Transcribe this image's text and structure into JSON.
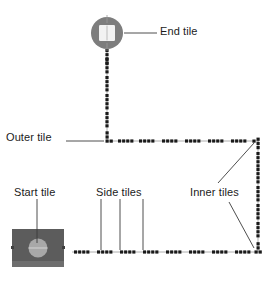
{
  "figure": {
    "background_color": "#ffffff",
    "tile_color": "#1a1a1a",
    "tile_track_color": "#9a9a9a",
    "start_tile_body_color": "#5c5c5c",
    "start_tile_base_color": "#6e6e6e",
    "start_tile_disc_color": "#a8a8a8",
    "end_tile_circle_color": "#7d7d7d",
    "end_tile_inner_color": "#f2f2f2",
    "leader_line_color": "#3a3a3a",
    "text_color": "#1b1b1b"
  },
  "labels": {
    "end_tile": "End tile",
    "outer_tile": "Outer tile",
    "start_tile": "Start tile",
    "side_tiles": "Side tiles",
    "inner_tiles": "Inner tiles"
  },
  "track": {
    "description": "Dashed tile path running from the start tile, rightwards along the bottom, up the right side, leftwards along the middle, then up to the end tile.",
    "segments": [
      {
        "name": "bottom-run",
        "orientation": "horizontal",
        "from": [
          72,
          252
        ],
        "to": [
          258,
          252
        ],
        "tile_groups": 8
      },
      {
        "name": "right-column",
        "orientation": "vertical",
        "from": [
          258,
          252
        ],
        "to": [
          258,
          141
        ],
        "tile_groups": 6
      },
      {
        "name": "middle-run",
        "orientation": "horizontal",
        "from": [
          258,
          141
        ],
        "to": [
          107,
          141
        ],
        "tile_groups": 7
      },
      {
        "name": "top-column",
        "orientation": "vertical",
        "from": [
          107,
          141
        ],
        "to": [
          107,
          52
        ],
        "tile_groups": 5
      }
    ],
    "corners": [
      {
        "name": "outer-corner",
        "x": 107,
        "y": 141,
        "kind": "outer"
      },
      {
        "name": "inner-corner-top-right",
        "x": 258,
        "y": 141,
        "kind": "inner"
      },
      {
        "name": "inner-corner-bottom-right",
        "x": 258,
        "y": 252,
        "kind": "inner"
      }
    ]
  },
  "pieces": {
    "start_tile": {
      "x": 12,
      "y": 229,
      "width": 52,
      "height": 38
    },
    "end_tile": {
      "cx": 107,
      "cy": 33,
      "r": 16
    }
  },
  "leaders": {
    "end_tile": [
      {
        "x1": 124,
        "y1": 33,
        "x2": 157,
        "y2": 33
      }
    ],
    "outer_tile": [
      {
        "x1": 66,
        "y1": 141,
        "x2": 105,
        "y2": 141
      }
    ],
    "start_tile": [
      {
        "x1": 37,
        "y1": 199,
        "x2": 37,
        "y2": 243
      }
    ],
    "side_tiles": [
      {
        "x1": 101,
        "y1": 199,
        "x2": 101,
        "y2": 250
      },
      {
        "x1": 120,
        "y1": 199,
        "x2": 120,
        "y2": 250
      },
      {
        "x1": 143,
        "y1": 199,
        "x2": 143,
        "y2": 250
      }
    ],
    "inner_tiles": [
      {
        "x1": 218,
        "y1": 183,
        "x2": 255,
        "y2": 144
      },
      {
        "x1": 229,
        "y1": 202,
        "x2": 255,
        "y2": 248
      }
    ]
  }
}
